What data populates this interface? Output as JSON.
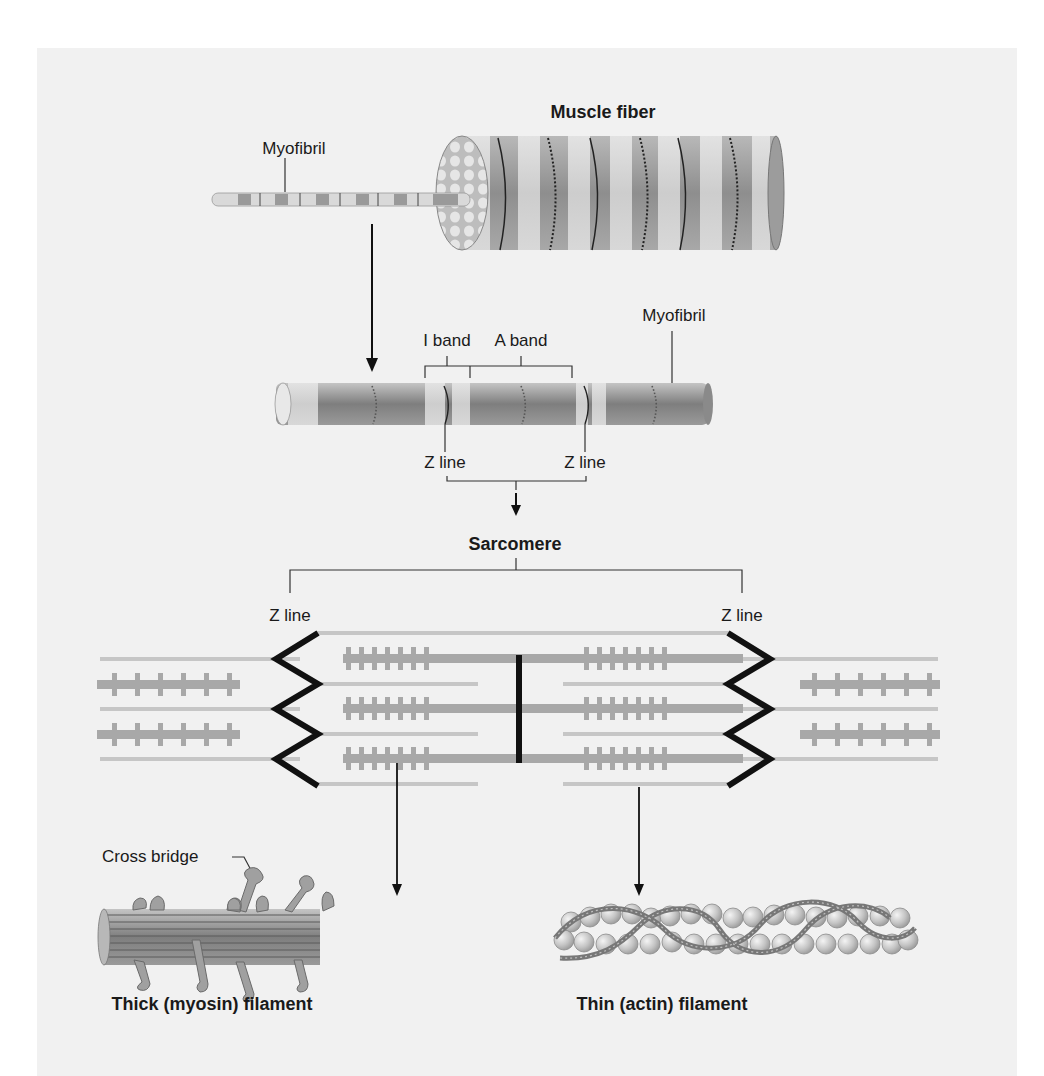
{
  "figure": {
    "background": "#f1f1f1",
    "colors": {
      "band_dark": "#9a9a9a",
      "band_light": "#d6d6d6",
      "filament_gray": "#a8a8a8",
      "thin_line": "#c6c6c6",
      "z_line": "#111111",
      "text": "#1a1a1a"
    },
    "section_muscle_fiber": {
      "title": "Muscle fiber",
      "myofibril_label": "Myofibril"
    },
    "section_myofibril": {
      "myofibril_label": "Myofibril",
      "i_band_label": "I band",
      "a_band_label": "A band",
      "z_line_left_label": "Z line",
      "z_line_right_label": "Z line"
    },
    "section_sarcomere": {
      "title": "Sarcomere",
      "z_line_left_label": "Z line",
      "z_line_right_label": "Z line"
    },
    "section_filaments": {
      "cross_bridge_label": "Cross bridge",
      "thick_caption": "Thick (myosin) filament",
      "thin_caption": "Thin (actin) filament"
    }
  }
}
